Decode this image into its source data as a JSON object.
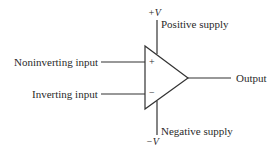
{
  "diagram": {
    "labels": {
      "noninverting": "Noninverting input",
      "inverting": "Inverting input",
      "output": "Output",
      "positive_supply": "Positive supply",
      "negative_supply": "Negative supply",
      "plus_v": "+V",
      "minus_v": "−V",
      "plus_sign": "+",
      "minus_sign": "−"
    },
    "colors": {
      "line": "#333333",
      "text": "#2a2a2a"
    }
  }
}
